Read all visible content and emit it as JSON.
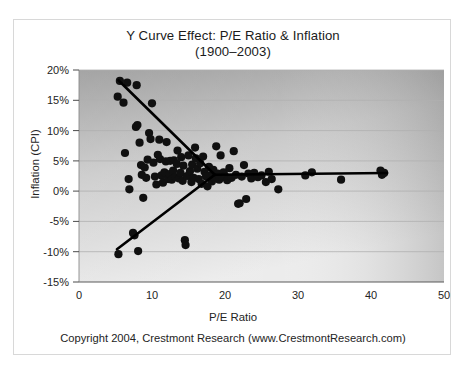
{
  "figure": {
    "title_line1": "Y Curve Effect: P/E Ratio & Inflation",
    "title_line2": "(1900–2003)",
    "footer": "Copyright 2004, Crestmont Research (www.CrestmontResearch.com)"
  },
  "colors": {
    "marker": "#101010",
    "trendline": "#000000",
    "plot_bg_top": "#9d9d9d",
    "plot_bg_bottom": "#e8e8e8",
    "gridline": "#b4b4b4",
    "axis": "#5a5a5a",
    "text": "#232323",
    "card_border": "#d8d8d8"
  },
  "chart_data": {
    "type": "scatter",
    "title": "Y Curve Effect: P/E Ratio & Inflation (1900–2003)",
    "xlabel": "P/E Ratio",
    "ylabel": "Inflation (CPI)",
    "xlim": [
      0,
      50
    ],
    "ylim": [
      -15,
      20
    ],
    "xticks": [
      0,
      10,
      20,
      30,
      40,
      50
    ],
    "yticks": [
      -15,
      -10,
      -5,
      0,
      5,
      10,
      15,
      20
    ],
    "xtick_labels": [
      "0",
      "10",
      "20",
      "30",
      "40",
      "50"
    ],
    "ytick_labels": [
      "-15%",
      "-10%",
      "-5%",
      "0%",
      "5%",
      "10%",
      "15%",
      "20%"
    ],
    "grid": "horizontal",
    "legend": "none",
    "y_unit": "percent",
    "points": [
      [
        5.3,
        15.6
      ],
      [
        5.4,
        -10.4
      ],
      [
        5.6,
        18.2
      ],
      [
        6.1,
        14.6
      ],
      [
        6.3,
        6.3
      ],
      [
        6.6,
        17.9
      ],
      [
        6.8,
        2.0
      ],
      [
        6.9,
        0.3
      ],
      [
        7.4,
        -6.9
      ],
      [
        7.6,
        -7.3
      ],
      [
        7.8,
        10.6
      ],
      [
        7.9,
        17.5
      ],
      [
        8.0,
        10.9
      ],
      [
        8.1,
        -9.9
      ],
      [
        8.3,
        8.0
      ],
      [
        8.5,
        4.3
      ],
      [
        8.6,
        2.7
      ],
      [
        8.8,
        -1.1
      ],
      [
        9.0,
        3.9
      ],
      [
        9.2,
        2.2
      ],
      [
        9.4,
        5.2
      ],
      [
        9.6,
        9.6
      ],
      [
        9.8,
        8.6
      ],
      [
        10.0,
        14.5
      ],
      [
        10.2,
        4.7
      ],
      [
        10.4,
        2.4
      ],
      [
        10.6,
        1.1
      ],
      [
        10.8,
        6.0
      ],
      [
        11.0,
        8.5
      ],
      [
        11.1,
        5.3
      ],
      [
        11.3,
        2.6
      ],
      [
        11.5,
        1.4
      ],
      [
        11.7,
        3.1
      ],
      [
        11.9,
        4.9
      ],
      [
        12.0,
        8.1
      ],
      [
        12.2,
        2.0
      ],
      [
        12.4,
        2.8
      ],
      [
        12.5,
        5.0
      ],
      [
        12.7,
        1.9
      ],
      [
        12.9,
        3.4
      ],
      [
        13.0,
        5.1
      ],
      [
        13.2,
        2.3
      ],
      [
        13.4,
        4.5
      ],
      [
        13.5,
        6.7
      ],
      [
        13.7,
        2.1
      ],
      [
        13.9,
        3.0
      ],
      [
        14.0,
        5.6
      ],
      [
        14.2,
        1.7
      ],
      [
        14.3,
        4.2
      ],
      [
        14.5,
        -8.1
      ],
      [
        14.6,
        -8.9
      ],
      [
        14.8,
        2.5
      ],
      [
        15.0,
        5.9
      ],
      [
        15.2,
        3.3
      ],
      [
        15.4,
        1.5
      ],
      [
        15.5,
        4.4
      ],
      [
        15.7,
        2.2
      ],
      [
        15.9,
        7.2
      ],
      [
        16.0,
        5.4
      ],
      [
        16.2,
        3.7
      ],
      [
        16.4,
        2.0
      ],
      [
        16.6,
        4.6
      ],
      [
        16.8,
        1.2
      ],
      [
        17.0,
        5.7
      ],
      [
        17.2,
        3.2
      ],
      [
        17.4,
        2.4
      ],
      [
        17.6,
        0.8
      ],
      [
        17.8,
        4.0
      ],
      [
        18.0,
        2.6
      ],
      [
        18.2,
        1.6
      ],
      [
        18.4,
        3.5
      ],
      [
        18.6,
        2.1
      ],
      [
        18.8,
        7.4
      ],
      [
        19.0,
        2.9
      ],
      [
        19.2,
        1.9
      ],
      [
        19.4,
        5.9
      ],
      [
        19.6,
        2.3
      ],
      [
        19.8,
        3.1
      ],
      [
        20.0,
        2.5
      ],
      [
        20.3,
        1.8
      ],
      [
        20.6,
        3.8
      ],
      [
        20.9,
        2.2
      ],
      [
        21.2,
        6.6
      ],
      [
        21.5,
        2.7
      ],
      [
        21.8,
        -2.1
      ],
      [
        22.0,
        -2.0
      ],
      [
        22.3,
        2.4
      ],
      [
        22.6,
        4.3
      ],
      [
        22.9,
        -1.3
      ],
      [
        23.2,
        2.9
      ],
      [
        23.6,
        2.1
      ],
      [
        24.0,
        3.0
      ],
      [
        24.5,
        2.3
      ],
      [
        25.0,
        2.6
      ],
      [
        25.6,
        1.5
      ],
      [
        26.0,
        3.2
      ],
      [
        26.4,
        2.0
      ],
      [
        27.3,
        0.3
      ],
      [
        31.0,
        2.6
      ],
      [
        31.9,
        3.1
      ],
      [
        35.9,
        1.9
      ],
      [
        41.3,
        3.4
      ],
      [
        41.5,
        2.7
      ],
      [
        41.8,
        3.0
      ]
    ],
    "trendlines": [
      {
        "name": "upper-branch",
        "x0": 5.4,
        "y0": 18.3,
        "x1": 18.6,
        "y1": 2.7
      },
      {
        "name": "lower-branch",
        "x0": 5.2,
        "y0": -9.6,
        "x1": 18.6,
        "y1": 2.7
      },
      {
        "name": "horizontal-branch",
        "x0": 18.6,
        "y0": 2.7,
        "x1": 42.2,
        "y1": 3.0
      }
    ]
  }
}
